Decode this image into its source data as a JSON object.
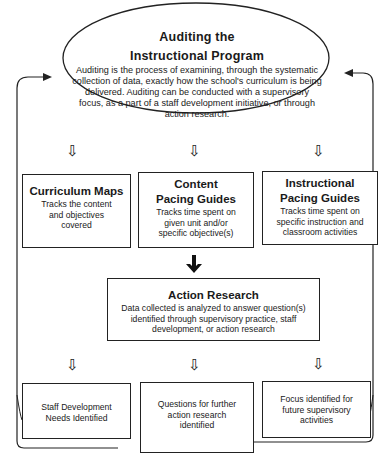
{
  "header": {
    "title_line1": "Auditing the",
    "title_line2": "Instructional Program",
    "description": "Auditing is the process of examining, through the systematic collection of data, exactly how the school's curriculum is being delivered. Auditing can be conducted with a supervisory focus, as a part of a staff development initiative, or through action research."
  },
  "tools": [
    {
      "title": "Curriculum Maps",
      "description": "Tracks the content and objectives covered"
    },
    {
      "title_line1": "Content",
      "title_line2": "Pacing Guides",
      "description": "Tracks time spent on given unit and/or specific objective(s)"
    },
    {
      "title_line1": "Instructional",
      "title_line2": "Pacing Guides",
      "description": "Tracks time spent on specific instruction and classroom activities"
    }
  ],
  "action_research": {
    "title": "Action Research",
    "description": "Data collected is analyzed to answer question(s) identified through supervisory practice, staff development, or action research"
  },
  "outcomes": [
    {
      "label": "Staff Development Needs Identified"
    },
    {
      "label": "Questions for further action research identified"
    },
    {
      "label": "Focus identified for future supervisory activities"
    }
  ],
  "icons": {
    "hollow_down_arrow": "⇩"
  }
}
